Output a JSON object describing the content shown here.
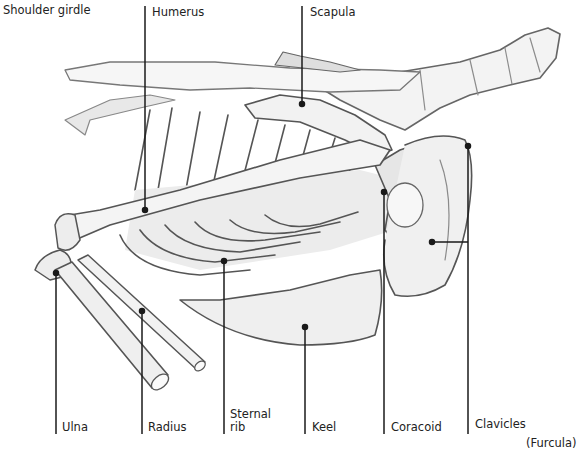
{
  "diagram": {
    "labels": {
      "shoulder_girdle": "Shoulder girdle",
      "humerus": "Humerus",
      "scapula": "Scapula",
      "ulna": "Ulna",
      "radius": "Radius",
      "sternal_rib_line1": "Sternal",
      "sternal_rib_line2": "rib",
      "keel": "Keel",
      "coracoid": "Coracoid",
      "clavicles": "Clavicles",
      "furcula": "(Furcula)"
    },
    "colors": {
      "line": "#1a1a1a",
      "sketch_dark": "#555555",
      "sketch_mid": "#9a9a9a",
      "sketch_light": "#d4d4d4",
      "background": "#ffffff"
    }
  }
}
